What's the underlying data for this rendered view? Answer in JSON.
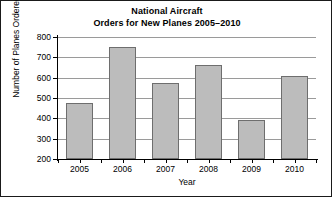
{
  "chart_data": {
    "type": "bar",
    "title_lines": [
      "National Aircraft",
      "Orders for New Planes 2005–2010"
    ],
    "categories": [
      "2005",
      "2006",
      "2007",
      "2008",
      "2009",
      "2010"
    ],
    "values": [
      475,
      750,
      575,
      660,
      390,
      610
    ],
    "xlabel": "Year",
    "ylabel": "Number of Planes Ordered",
    "ylim": [
      200,
      800
    ],
    "ytick_step": 100,
    "yticks": [
      "800",
      "700",
      "600",
      "500",
      "400",
      "300",
      "200"
    ],
    "ytick_values": [
      800,
      700,
      600,
      500,
      400,
      300,
      200
    ],
    "grid": "horizontal",
    "legend": "none",
    "bar_fill_color": "#bcbcbc",
    "bar_edge_color": "#6e6e6e",
    "grid_color": "#9a9a9a",
    "axis_color": "#000000",
    "background_color": "#ffffff"
  }
}
